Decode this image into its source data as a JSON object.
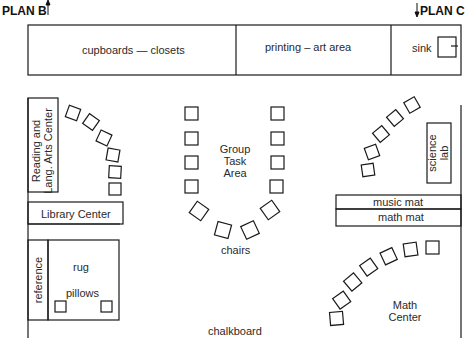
{
  "plan_labels": {
    "left": "PLAN B",
    "right": "PLAN C"
  },
  "top_wall": {
    "sections": [
      {
        "label": "cupboards — closets"
      },
      {
        "label": "printing  –  art area"
      },
      {
        "label": "sink"
      }
    ]
  },
  "areas": {
    "reading": {
      "line1": "Reading and",
      "line2": "Lang. Arts Center"
    },
    "library": "Library Center",
    "reference": "reference",
    "rug": "rug",
    "pillows": "pillows",
    "group_task": {
      "line1": "Group",
      "line2": "Task",
      "line3": "Area"
    },
    "chairs": "chairs",
    "science": {
      "line1": "science",
      "line2": "lab"
    },
    "music_mat": "music mat",
    "math_mat": "math mat",
    "math_center": {
      "line1": "Math",
      "line2": "Center"
    },
    "chalkboard": "chalkboard"
  },
  "colors": {
    "line": "#1a1a1a",
    "background": "#ffffff"
  }
}
